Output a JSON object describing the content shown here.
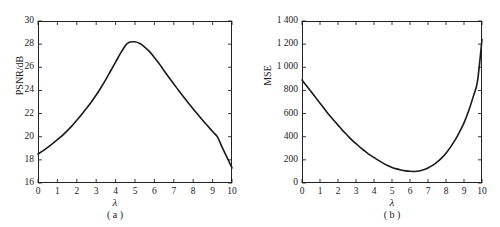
{
  "figure": {
    "panels": [
      {
        "caption": "( a )",
        "xlabel": "λ",
        "ylabel": "PSNR/dB",
        "xticks": [
          "0",
          "1",
          "2",
          "3",
          "4",
          "5",
          "6",
          "7",
          "8",
          "9",
          "10"
        ],
        "yticks": [
          "30",
          "28",
          "26",
          "24",
          "22",
          "20",
          "18",
          "16"
        ]
      },
      {
        "caption": "( b )",
        "xlabel": "λ",
        "ylabel": "MSE",
        "xticks": [
          "0",
          "1",
          "2",
          "3",
          "4",
          "5",
          "6",
          "7",
          "8",
          "9",
          "10"
        ],
        "yticks": [
          "1 400",
          "1 200",
          "1 000",
          "800",
          "600",
          "400",
          "200",
          "0"
        ]
      }
    ]
  },
  "chart_data": [
    {
      "type": "line",
      "title": "( a )",
      "xlabel": "λ",
      "ylabel": "PSNR/dB",
      "xlim": [
        0,
        10
      ],
      "ylim": [
        16,
        30
      ],
      "xticks": [
        0,
        1,
        2,
        3,
        4,
        5,
        6,
        7,
        8,
        9,
        10
      ],
      "yticks": [
        16,
        18,
        20,
        22,
        24,
        26,
        28,
        30
      ],
      "grid": false,
      "legend": null,
      "line_color": "#1a1a1a",
      "x": [
        0,
        0.25,
        0.5,
        0.75,
        1,
        1.25,
        1.5,
        1.75,
        2,
        2.25,
        2.5,
        2.75,
        3,
        3.25,
        3.5,
        3.75,
        4,
        4.25,
        4.5,
        4.6,
        4.75,
        5,
        5.25,
        5.5,
        5.75,
        6,
        6.25,
        6.5,
        6.75,
        7,
        7.25,
        7.5,
        7.75,
        8,
        8.25,
        8.5,
        8.75,
        9,
        9.25,
        9.5,
        9.75,
        10
      ],
      "values": [
        18.5,
        18.78,
        19.08,
        19.4,
        19.74,
        20.1,
        20.5,
        20.94,
        21.42,
        21.92,
        22.45,
        23.0,
        23.6,
        24.25,
        24.95,
        25.7,
        26.45,
        27.2,
        27.86,
        28.05,
        28.18,
        28.2,
        28.05,
        27.75,
        27.35,
        26.85,
        26.3,
        25.7,
        25.12,
        24.55,
        24.0,
        23.45,
        22.92,
        22.4,
        21.9,
        21.4,
        20.92,
        20.45,
        19.98,
        19.05,
        18.2,
        17.3
      ],
      "annotations": {
        "peak_x": 5.0,
        "peak_y": 28.2,
        "start_y": 18.5,
        "end_y": 17.3
      }
    },
    {
      "type": "line",
      "title": "( b )",
      "xlabel": "λ",
      "ylabel": "MSE",
      "xlim": [
        0,
        10
      ],
      "ylim": [
        0,
        1400
      ],
      "xticks": [
        0,
        1,
        2,
        3,
        4,
        5,
        6,
        7,
        8,
        9,
        10
      ],
      "yticks": [
        0,
        200,
        400,
        600,
        800,
        1000,
        1200,
        1400
      ],
      "ytick_labels": [
        "0",
        "200",
        "400",
        "600",
        "800",
        "1 000",
        "1 200",
        "1 400"
      ],
      "grid": false,
      "legend": null,
      "line_color": "#1a1a1a",
      "x": [
        0,
        0.25,
        0.5,
        0.75,
        1,
        1.25,
        1.5,
        1.75,
        2,
        2.25,
        2.5,
        2.75,
        3,
        3.25,
        3.5,
        3.75,
        4,
        4.25,
        4.5,
        4.75,
        5,
        5.25,
        5.5,
        5.75,
        6,
        6.25,
        6.5,
        6.75,
        7,
        7.25,
        7.5,
        7.75,
        8,
        8.25,
        8.5,
        8.75,
        9,
        9.25,
        9.5,
        9.75,
        10
      ],
      "values": [
        890,
        840,
        790,
        740,
        690,
        640,
        590,
        545,
        500,
        455,
        415,
        375,
        340,
        305,
        275,
        245,
        220,
        195,
        172,
        152,
        135,
        122,
        112,
        105,
        101,
        100,
        104,
        114,
        130,
        152,
        180,
        215,
        258,
        310,
        370,
        440,
        520,
        620,
        740,
        880,
        1240
      ],
      "annotations": {
        "min_x": 4.6,
        "min_y": 100,
        "start_y": 890,
        "end_y": 1240
      }
    }
  ]
}
